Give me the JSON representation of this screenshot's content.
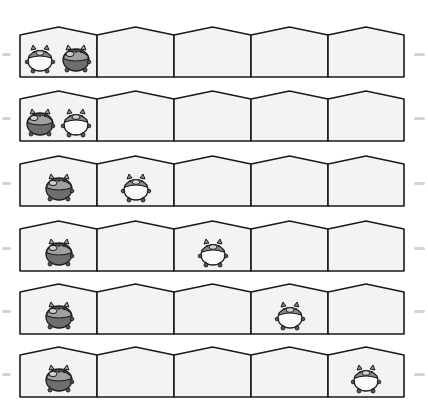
{
  "figure": {
    "type": "pigs-in-houses-sequence",
    "rows_count": 6,
    "houses_per_row": 5,
    "colors": {
      "house_fill": "#f3f3f3",
      "outline": "#1a1a1a",
      "dark_pig_body": "#6e6e6e",
      "light_pig_body": "#fafafa",
      "pig_head": "#9a9a9a"
    }
  },
  "rows": [
    {
      "index": 1,
      "top": 26,
      "pigs": [
        {
          "house": 1,
          "slot": "left",
          "style": "light"
        },
        {
          "house": 1,
          "slot": "right",
          "style": "dark"
        }
      ]
    },
    {
      "index": 2,
      "top": 90,
      "pigs": [
        {
          "house": 1,
          "slot": "left",
          "style": "dark"
        },
        {
          "house": 1,
          "slot": "right",
          "style": "light"
        }
      ]
    },
    {
      "index": 3,
      "top": 155,
      "pigs": [
        {
          "house": 1,
          "slot": "center",
          "style": "dark"
        },
        {
          "house": 2,
          "slot": "center",
          "style": "light"
        }
      ]
    },
    {
      "index": 4,
      "top": 220,
      "pigs": [
        {
          "house": 1,
          "slot": "center",
          "style": "dark"
        },
        {
          "house": 3,
          "slot": "center",
          "style": "light"
        }
      ]
    },
    {
      "index": 5,
      "top": 283,
      "pigs": [
        {
          "house": 1,
          "slot": "center",
          "style": "dark"
        },
        {
          "house": 4,
          "slot": "center",
          "style": "light"
        }
      ]
    },
    {
      "index": 6,
      "top": 346,
      "pigs": [
        {
          "house": 1,
          "slot": "center",
          "style": "dark"
        },
        {
          "house": 5,
          "slot": "center",
          "style": "light"
        }
      ]
    }
  ]
}
